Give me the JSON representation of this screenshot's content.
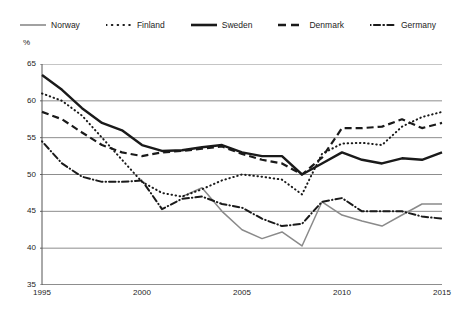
{
  "legend": {
    "position": "top-center",
    "items": [
      {
        "label": "Norway",
        "style": "solid-thin",
        "color": "#8a8a8a"
      },
      {
        "label": "Finland",
        "style": "dotted",
        "color": "#1a1a1a"
      },
      {
        "label": "Sweden",
        "style": "solid-thick",
        "color": "#1a1a1a"
      },
      {
        "label": "Denmark",
        "style": "dashed",
        "color": "#1a1a1a"
      },
      {
        "label": "Germany",
        "style": "dash-dot",
        "color": "#1a1a1a"
      }
    ]
  },
  "axes": {
    "unit_label": "%",
    "y_ticks": [
      "35",
      "40",
      "45",
      "50",
      "55",
      "60",
      "65"
    ],
    "x_ticks": [
      "1995",
      "2000",
      "2005",
      "2010",
      "2015"
    ]
  },
  "chart_data": {
    "type": "line",
    "title": "",
    "subtitle": "",
    "xlabel": "",
    "ylabel": "%",
    "xlim": [
      1995,
      2015
    ],
    "ylim": [
      35,
      65
    ],
    "yticks": [
      35,
      40,
      45,
      50,
      55,
      60,
      65
    ],
    "xticks": [
      1995,
      2000,
      2005,
      2010,
      2015
    ],
    "grid": "horizontal",
    "legend_position": "top-center",
    "x": [
      1995,
      1996,
      1997,
      1998,
      1999,
      2000,
      2001,
      2002,
      2003,
      2004,
      2005,
      2006,
      2007,
      2008,
      2009,
      2010,
      2011,
      2012,
      2013,
      2014,
      2015
    ],
    "series": [
      {
        "name": "Norway",
        "style": "solid-thin",
        "color": "#8a8a8a",
        "values": [
          null,
          null,
          null,
          null,
          null,
          null,
          null,
          47.0,
          48.2,
          45.0,
          42.5,
          41.3,
          42.2,
          40.3,
          46.3,
          44.5,
          43.7,
          43.0,
          44.5,
          46.0,
          46.0
        ]
      },
      {
        "name": "Finland",
        "style": "dotted",
        "color": "#1a1a1a",
        "values": [
          61.0,
          60.0,
          58.0,
          55.0,
          52.0,
          49.0,
          47.5,
          47.0,
          48.0,
          49.2,
          50.0,
          49.7,
          49.3,
          47.3,
          52.8,
          54.2,
          54.3,
          54.0,
          56.5,
          57.8,
          58.5
        ]
      },
      {
        "name": "Sweden",
        "style": "solid-thick",
        "color": "#1a1a1a",
        "values": [
          63.5,
          61.5,
          59.0,
          57.0,
          56.0,
          54.0,
          53.2,
          53.3,
          53.7,
          54.0,
          53.0,
          52.5,
          52.5,
          50.0,
          51.5,
          53.0,
          52.0,
          51.5,
          52.2,
          52.0,
          53.0
        ]
      },
      {
        "name": "Denmark",
        "style": "dashed",
        "color": "#1a1a1a",
        "values": [
          58.5,
          57.5,
          55.7,
          54.0,
          53.0,
          52.5,
          53.0,
          53.2,
          53.5,
          53.8,
          52.8,
          52.0,
          51.5,
          50.0,
          52.3,
          56.3,
          56.3,
          56.5,
          57.5,
          56.3,
          57.0
        ]
      },
      {
        "name": "Germany",
        "style": "dash-dot",
        "color": "#1a1a1a",
        "values": [
          54.5,
          51.5,
          49.7,
          49.0,
          49.0,
          49.2,
          45.3,
          46.7,
          47.0,
          46.0,
          45.5,
          44.0,
          43.0,
          43.3,
          46.3,
          46.8,
          45.0,
          45.0,
          45.0,
          44.3,
          44.0
        ]
      }
    ]
  }
}
